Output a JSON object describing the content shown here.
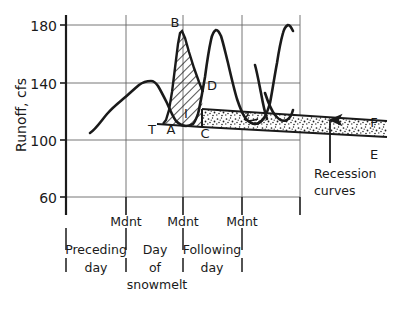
{
  "chart_data": {
    "type": "line",
    "title": "",
    "xlabel": "",
    "ylabel": "Runoff, cfs",
    "ylim": [
      40,
      195
    ],
    "yticks": [
      60,
      100,
      140,
      180
    ],
    "ytick_labels": [
      "60",
      "100",
      "140",
      "180"
    ],
    "grid": true,
    "x_axis_kind": "time",
    "x_gridlines": [
      "day-start",
      "Mdnt",
      "Mdnt",
      "Mdnt",
      "day-end"
    ],
    "x_tick_labels": [
      "Mdnt",
      "Mdnt",
      "Mdnt"
    ],
    "x_category_labels": [
      "Preceding day",
      "Day of snowmelt",
      "Following day"
    ],
    "series": [
      {
        "name": "runoff hydrograph",
        "points": [
          {
            "x": 0.4,
            "y": 107
          },
          {
            "x": 0.6,
            "y": 125
          },
          {
            "x": 0.72,
            "y": 131
          },
          {
            "x": 0.86,
            "y": 138
          },
          {
            "x": 1.0,
            "y": 143
          },
          {
            "x": 1.12,
            "y": 143
          },
          {
            "x": 1.26,
            "y": 136
          },
          {
            "x": 1.45,
            "y": 125
          },
          {
            "x": 1.58,
            "y": 118
          },
          {
            "x": 1.66,
            "y": 117
          },
          {
            "x": 1.74,
            "y": 119
          },
          {
            "x": 1.82,
            "y": 140
          },
          {
            "x": 1.9,
            "y": 172
          },
          {
            "x": 1.95,
            "y": 175
          },
          {
            "x": 2.02,
            "y": 163
          },
          {
            "x": 2.14,
            "y": 146
          },
          {
            "x": 2.3,
            "y": 132
          },
          {
            "x": 2.44,
            "y": 124
          },
          {
            "x": 2.52,
            "y": 122
          },
          {
            "x": 2.6,
            "y": 130
          },
          {
            "x": 2.7,
            "y": 160
          },
          {
            "x": 2.8,
            "y": 182
          },
          {
            "x": 2.88,
            "y": 184
          },
          {
            "x": 2.98,
            "y": 172
          },
          {
            "x": 3.12,
            "y": 155
          },
          {
            "x": 3.28,
            "y": 143
          },
          {
            "x": 3.42,
            "y": 137
          },
          {
            "x": 3.54,
            "y": 136
          },
          {
            "x": 3.64,
            "y": 140
          },
          {
            "x": 3.72,
            "y": 145
          }
        ]
      }
    ],
    "shaded_regions": [
      {
        "name": "snowmelt-runoff-increment",
        "fill": "diagonal-hatch",
        "label": "I",
        "bounds_note": "between baseflow line T-A-C and rising/falling limb of snowmelt peak"
      },
      {
        "name": "recession-curve-band",
        "fill": "stipple",
        "label": "2",
        "bounds_note": "band between recession curves D-F and C-E"
      }
    ],
    "point_labels": [
      {
        "label": "T",
        "x": 1.6,
        "y": 112
      },
      {
        "label": "A",
        "x": 1.74,
        "y": 112
      },
      {
        "label": "B",
        "x": 1.93,
        "y": 184
      },
      {
        "label": "C",
        "x": 2.6,
        "y": 112
      },
      {
        "label": "D",
        "x": 2.57,
        "y": 137
      },
      {
        "label": "I",
        "x": 2.3,
        "y": 120
      },
      {
        "label": "E",
        "x": 4.1,
        "y": 104
      },
      {
        "label": "F",
        "x": 4.1,
        "y": 117
      },
      {
        "label": "2",
        "x": 3.1,
        "y": 116
      }
    ],
    "annotations": [
      {
        "text": "Recession curves",
        "kind": "leader-arrow",
        "points_to": "recession-curve-band"
      }
    ]
  },
  "axes": {
    "y_title": "Runoff, cfs",
    "y_ticks": [
      "180",
      "140",
      "100",
      "60"
    ]
  },
  "x_axis": {
    "midnight_labels": [
      "Mdnt",
      "Mdnt",
      "Mdnt"
    ],
    "day_groups": [
      {
        "line1": "Preceding",
        "line2": "day",
        "line3": ""
      },
      {
        "line1": "Day",
        "line2": "of",
        "line3": "snowmelt"
      },
      {
        "line1": "Following",
        "line2": "day",
        "line3": ""
      }
    ]
  },
  "labels": {
    "T": "T",
    "A": "A",
    "B": "B",
    "C": "C",
    "D": "D",
    "I": "I",
    "E": "E",
    "F": "F",
    "band_number": "2"
  },
  "annotation": {
    "recession_line1": "Recession",
    "recession_line2": "curves"
  },
  "colors": {
    "ink": "#1a1a1a",
    "grid": "#555555",
    "background": "#ffffff"
  }
}
